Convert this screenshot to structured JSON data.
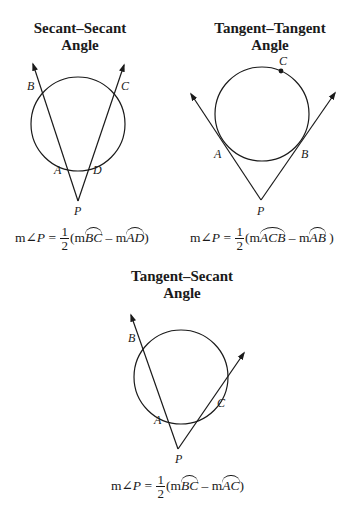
{
  "diagrams": [
    {
      "title_line1": "Secant–Secant",
      "title_line2": "Angle",
      "points": {
        "B": "B",
        "C": "C",
        "A": "A",
        "D": "D",
        "P": "P"
      },
      "formula": {
        "lhs_m": "m",
        "angle": "∠",
        "lhs_var": "P",
        "eq": " = ",
        "num": "1",
        "den": "2",
        "open": "(m",
        "arc1": "BC",
        "minus": " – m",
        "arc2": "AD",
        "close": ")"
      }
    },
    {
      "title_line1": "Tangent–Tangent",
      "title_line2": "Angle",
      "points": {
        "C": "C",
        "A": "A",
        "B": "B",
        "P": "P"
      },
      "formula": {
        "lhs_m": "m",
        "angle": "∠",
        "lhs_var": "P",
        "eq": " = ",
        "num": "1",
        "den": "2",
        "open": "(m",
        "arc1": "ACB",
        "minus": " –  m",
        "arc2": "AB",
        "close": " )"
      }
    },
    {
      "title_line1": "Tangent–Secant",
      "title_line2": "Angle",
      "points": {
        "B": "B",
        "A": "A",
        "C": "C",
        "P": "P"
      },
      "formula": {
        "lhs_m": "m",
        "angle": "∠",
        "lhs_var": "P",
        "eq": " = ",
        "num": "1",
        "den": "2",
        "open": "(m",
        "arc1": "BC",
        "minus": " –  m",
        "arc2": "AC",
        "close": ")"
      }
    }
  ],
  "colors": {
    "ink": "#1a1a1a",
    "background": "#ffffff"
  }
}
